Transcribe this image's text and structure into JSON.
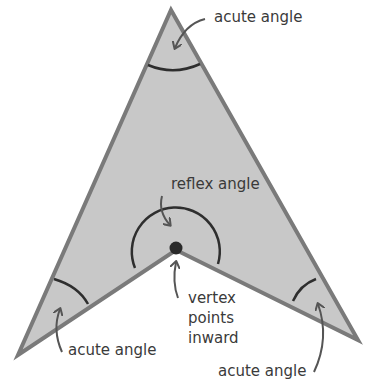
{
  "diagram": {
    "colors": {
      "fill": "#c8c8c8",
      "border": "#7a7a7a",
      "arc": "#2e2e2e",
      "arrow": "#555555",
      "text": "#3a3a3a",
      "vertex_dot": "#2a2a2a"
    },
    "shape": {
      "vertices": [
        {
          "name": "apex",
          "x": 171,
          "y": 10
        },
        {
          "name": "bottom-right",
          "x": 358,
          "y": 340
        },
        {
          "name": "inner-vertex",
          "x": 176,
          "y": 250
        },
        {
          "name": "bottom-left",
          "x": 18,
          "y": 355
        }
      ]
    },
    "labels": {
      "top_acute": "acute angle",
      "reflex": "reflex angle",
      "vertex_line1": "vertex",
      "vertex_line2": "points",
      "vertex_line3": "inward",
      "bottom_left_acute": "acute angle",
      "bottom_right_acute": "acute angle"
    }
  }
}
